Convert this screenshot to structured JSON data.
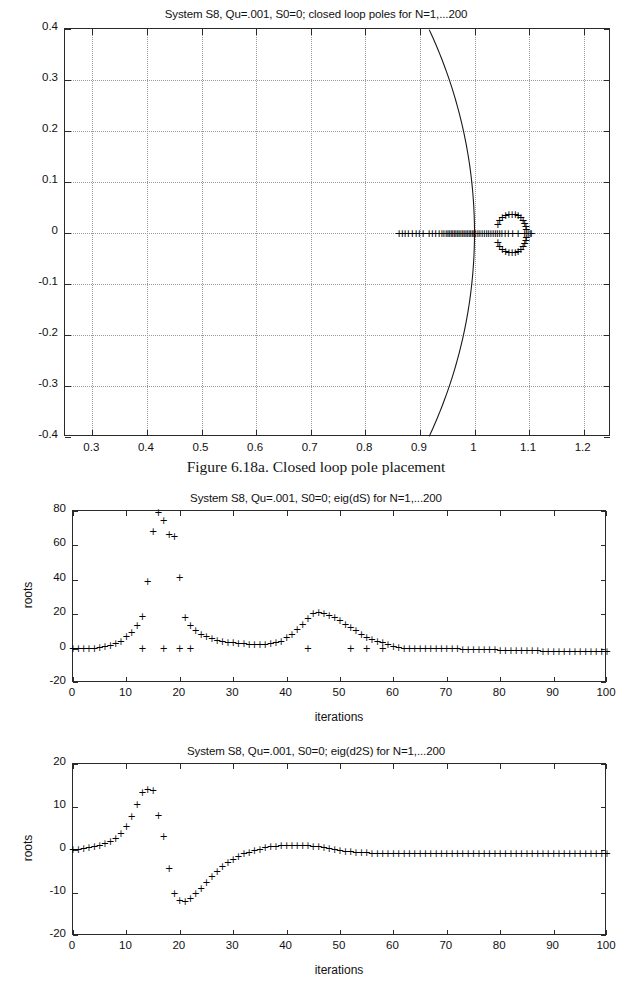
{
  "document": {
    "caption": "Figure 6.18a. Closed loop pole placement"
  },
  "figures": [
    {
      "id": "pole-plot",
      "title": "System S8, Qu=.001, S0=0; closed loop poles for N=1,...200",
      "xlabel": "",
      "ylabel": "",
      "xticks": [
        "0.3",
        "0.4",
        "0.5",
        "0.6",
        "0.7",
        "0.8",
        "0.9",
        "1",
        "1.1",
        "1.2"
      ],
      "yticks": [
        "0.4",
        "0.3",
        "0.2",
        "0.1",
        "0",
        "-0.1",
        "-0.2",
        "-0.3",
        "-0.4"
      ]
    },
    {
      "id": "eig-ds-plot",
      "title": "System S8, Qu=.001, S0=0; eig(dS) for N=1,...200",
      "xlabel": "iterations",
      "ylabel": "roots",
      "xticks": [
        "0",
        "10",
        "20",
        "30",
        "40",
        "50",
        "60",
        "70",
        "80",
        "90",
        "100"
      ],
      "yticks": [
        "80",
        "60",
        "40",
        "20",
        "0",
        "-20"
      ]
    },
    {
      "id": "eig-d2s-plot",
      "title": "System S8, Qu=.001, S0=0; eig(d2S) for N=1,...200",
      "xlabel": "iterations",
      "ylabel": "roots",
      "xticks": [
        "0",
        "10",
        "20",
        "30",
        "40",
        "50",
        "60",
        "70",
        "80",
        "90",
        "100"
      ],
      "yticks": [
        "20",
        "10",
        "0",
        "-10",
        "-20"
      ]
    }
  ],
  "chart_data": [
    {
      "type": "scatter",
      "id": "pole-plot",
      "title": "System S8, Qu=.001, S0=0; closed loop poles for N=1,...200",
      "xlabel": "",
      "ylabel": "",
      "xlim": [
        0.25,
        1.25
      ],
      "ylim": [
        -0.4,
        0.4
      ],
      "grid": true,
      "marker": "+",
      "annotations": [
        "unit circle arc passing through (1,0)"
      ],
      "series": [
        {
          "name": "closed loop poles",
          "points": [
            [
              0.862,
              0.0
            ],
            [
              0.868,
              0.0
            ],
            [
              0.873,
              0.0
            ],
            [
              0.879,
              0.0
            ],
            [
              0.886,
              0.0
            ],
            [
              0.893,
              0.0
            ],
            [
              0.899,
              0.0
            ],
            [
              0.906,
              0.0
            ],
            [
              0.917,
              0.0
            ],
            [
              0.923,
              0.0
            ],
            [
              0.929,
              0.0
            ],
            [
              0.935,
              0.0
            ],
            [
              0.94,
              0.0
            ],
            [
              0.944,
              0.0
            ],
            [
              0.948,
              0.0
            ],
            [
              0.951,
              0.0
            ],
            [
              0.954,
              0.0
            ],
            [
              0.957,
              0.0
            ],
            [
              0.96,
              0.0
            ],
            [
              0.963,
              0.0
            ],
            [
              0.966,
              0.0
            ],
            [
              0.969,
              0.0
            ],
            [
              0.972,
              0.0
            ],
            [
              0.975,
              0.0
            ],
            [
              0.978,
              0.0
            ],
            [
              0.981,
              0.0
            ],
            [
              0.984,
              0.0
            ],
            [
              0.987,
              0.0
            ],
            [
              0.99,
              0.0
            ],
            [
              0.993,
              0.0
            ],
            [
              0.996,
              0.0
            ],
            [
              0.999,
              0.0
            ],
            [
              1.002,
              0.0
            ],
            [
              1.006,
              0.0
            ],
            [
              1.01,
              0.0
            ],
            [
              1.014,
              0.0
            ],
            [
              1.018,
              0.0
            ],
            [
              1.022,
              0.0
            ],
            [
              1.026,
              0.0
            ],
            [
              1.03,
              0.0
            ],
            [
              1.034,
              0.0
            ],
            [
              1.038,
              0.0
            ],
            [
              1.042,
              0.0
            ],
            [
              1.046,
              0.0
            ],
            [
              1.05,
              0.0
            ],
            [
              1.056,
              0.0
            ],
            [
              1.062,
              0.0
            ],
            [
              1.07,
              0.0
            ],
            [
              1.08,
              0.0
            ],
            [
              1.092,
              0.0
            ],
            [
              1.098,
              0.0
            ],
            [
              1.102,
              0.0
            ],
            [
              1.104,
              0.0
            ],
            [
              1.043,
              0.018
            ],
            [
              1.046,
              0.026
            ],
            [
              1.051,
              0.031
            ],
            [
              1.057,
              0.035
            ],
            [
              1.063,
              0.037
            ],
            [
              1.069,
              0.038
            ],
            [
              1.075,
              0.037
            ],
            [
              1.08,
              0.035
            ],
            [
              1.085,
              0.031
            ],
            [
              1.089,
              0.026
            ],
            [
              1.092,
              0.02
            ],
            [
              1.094,
              0.013
            ],
            [
              1.095,
              0.007
            ],
            [
              1.043,
              -0.018
            ],
            [
              1.046,
              -0.026
            ],
            [
              1.051,
              -0.031
            ],
            [
              1.057,
              -0.035
            ],
            [
              1.063,
              -0.037
            ],
            [
              1.069,
              -0.038
            ],
            [
              1.075,
              -0.037
            ],
            [
              1.08,
              -0.035
            ],
            [
              1.085,
              -0.031
            ],
            [
              1.089,
              -0.026
            ],
            [
              1.092,
              -0.02
            ],
            [
              1.094,
              -0.013
            ],
            [
              1.095,
              -0.007
            ]
          ]
        }
      ]
    },
    {
      "type": "scatter",
      "id": "eig-ds-plot",
      "title": "System S8, Qu=.001, S0=0; eig(dS) for N=1,...200",
      "xlabel": "iterations",
      "ylabel": "roots",
      "xlim": [
        0,
        100
      ],
      "ylim": [
        -20,
        80
      ],
      "grid": false,
      "marker": "+",
      "series": [
        {
          "name": "eig(dS)",
          "x": [
            0,
            1,
            2,
            3,
            4,
            5,
            6,
            7,
            8,
            9,
            10,
            11,
            12,
            13,
            14,
            15,
            16,
            17,
            18,
            19,
            20,
            21,
            22,
            23,
            24,
            25,
            26,
            27,
            28,
            29,
            30,
            31,
            32,
            33,
            34,
            35,
            36,
            37,
            38,
            39,
            40,
            41,
            42,
            43,
            44,
            45,
            46,
            47,
            48,
            49,
            50,
            51,
            52,
            53,
            54,
            55,
            56,
            57,
            58,
            59,
            60,
            61,
            62,
            63,
            64,
            65,
            66,
            67,
            68,
            69,
            70,
            71,
            72,
            73,
            74,
            75,
            76,
            77,
            78,
            79,
            80,
            81,
            82,
            83,
            84,
            85,
            86,
            87,
            88,
            89,
            90,
            91,
            92,
            93,
            94,
            95,
            96,
            97,
            98,
            99,
            100
          ],
          "y": [
            0,
            0,
            0,
            0,
            0,
            0.5,
            1,
            1.5,
            2.5,
            4,
            6.5,
            9,
            13,
            18.5,
            39,
            68,
            79,
            74,
            66,
            65,
            41,
            18,
            13,
            10,
            8,
            6.5,
            5.5,
            4.5,
            4,
            3.5,
            3,
            2.5,
            2.5,
            2,
            2,
            2,
            2,
            2.5,
            3,
            4,
            6,
            8,
            11,
            14,
            17,
            20,
            20.5,
            20,
            19,
            18,
            16,
            14,
            12,
            10,
            8,
            6,
            5,
            4,
            3,
            2,
            1,
            0.5,
            0,
            0,
            0,
            0,
            0,
            0,
            -0.5,
            -0.5,
            -0.5,
            -0.5,
            -0.5,
            -1,
            -1,
            -1,
            -1,
            -1,
            -1,
            -1,
            -1.5,
            -1.5,
            -1.5,
            -1.5,
            -1.5,
            -1.5,
            -1.5,
            -1.5,
            -2,
            -2,
            -2,
            -2,
            -2,
            -2,
            -2,
            -2,
            -2,
            -2,
            -2,
            -2,
            -2
          ]
        },
        {
          "name": "outliers near zero",
          "x": [
            13,
            17,
            20,
            22,
            44,
            52,
            55,
            58
          ],
          "y": [
            0,
            0,
            0,
            0,
            0,
            0,
            0,
            0
          ]
        }
      ]
    },
    {
      "type": "scatter",
      "id": "eig-d2s-plot",
      "title": "System S8, Qu=.001, S0=0; eig(d2S) for N=1,...200",
      "xlabel": "iterations",
      "ylabel": "roots",
      "xlim": [
        0,
        100
      ],
      "ylim": [
        -20,
        20
      ],
      "grid": false,
      "marker": "+",
      "series": [
        {
          "name": "eig(d2S)",
          "x": [
            0,
            1,
            2,
            3,
            4,
            5,
            6,
            7,
            8,
            9,
            10,
            11,
            12,
            13,
            14,
            15,
            16,
            17,
            18,
            19,
            20,
            21,
            22,
            23,
            24,
            25,
            26,
            27,
            28,
            29,
            30,
            31,
            32,
            33,
            34,
            35,
            36,
            37,
            38,
            39,
            40,
            41,
            42,
            43,
            44,
            45,
            46,
            47,
            48,
            49,
            50,
            51,
            52,
            53,
            54,
            55,
            56,
            57,
            58,
            59,
            60,
            61,
            62,
            63,
            64,
            65,
            66,
            67,
            68,
            69,
            70,
            71,
            72,
            73,
            74,
            75,
            76,
            77,
            78,
            79,
            80,
            81,
            82,
            83,
            84,
            85,
            86,
            87,
            88,
            89,
            90,
            91,
            92,
            93,
            94,
            95,
            96,
            97,
            98,
            99,
            100
          ],
          "y": [
            0,
            0,
            0.2,
            0.4,
            0.6,
            0.9,
            1.3,
            1.8,
            2.6,
            3.7,
            5.4,
            7.6,
            10.4,
            13.3,
            14,
            13.8,
            7.8,
            3,
            -4.5,
            -10.2,
            -11.8,
            -12,
            -11.5,
            -10.3,
            -9,
            -7.6,
            -6.3,
            -5.1,
            -4,
            -3.1,
            -2.3,
            -1.6,
            -1,
            -0.6,
            -0.2,
            0.1,
            0.4,
            0.6,
            0.8,
            0.9,
            1,
            1,
            1,
            1,
            0.9,
            0.8,
            0.6,
            0.4,
            0.2,
            0,
            -0.2,
            -0.4,
            -0.5,
            -0.6,
            -0.7,
            -0.8,
            -0.9,
            -0.9,
            -1,
            -1,
            -1,
            -1,
            -1,
            -1,
            -1,
            -1,
            -1,
            -1,
            -1,
            -1,
            -1,
            -1,
            -1,
            -1,
            -1,
            -1,
            -1,
            -1,
            -1,
            -1,
            -1,
            -1,
            -1,
            -1,
            -1,
            -1,
            -1,
            -1,
            -1,
            -1,
            -1,
            -1,
            -1,
            -1,
            -1,
            -1,
            -1,
            -1,
            -1,
            -1,
            -1,
            -1
          ]
        }
      ]
    }
  ]
}
